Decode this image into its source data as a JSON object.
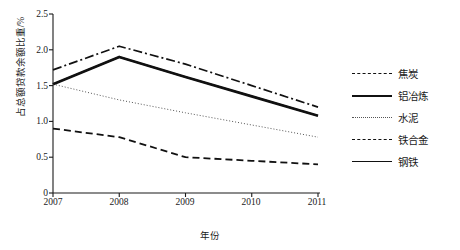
{
  "chart_data": {
    "type": "line",
    "title": "",
    "xlabel": "年份",
    "ylabel": "占总额贷款余额比重/%",
    "categories": [
      "2007",
      "2008",
      "2009",
      "2010",
      "2011"
    ],
    "x": [
      2007,
      2008,
      2009,
      2010,
      2011
    ],
    "ylim": [
      0,
      2.5
    ],
    "yticks": [
      "0",
      "0.5",
      "1.0",
      "1.5",
      "2.0",
      "2.5"
    ],
    "ytick_values": [
      0,
      0.5,
      1.0,
      1.5,
      2.0,
      2.5
    ],
    "grid": false,
    "legend_position": "right",
    "series": [
      {
        "name": "焦炭",
        "style": "dash-dot",
        "color": "#111111",
        "values": [
          1.72,
          2.05,
          1.8,
          1.5,
          1.2
        ]
      },
      {
        "name": "铝冶炼",
        "style": "solid-thick",
        "color": "#111111",
        "values": [
          1.52,
          1.9,
          1.62,
          1.35,
          1.08
        ]
      },
      {
        "name": "水泥",
        "style": "dotted",
        "color": "#555555",
        "values": [
          1.52,
          1.3,
          1.12,
          0.95,
          0.78
        ]
      },
      {
        "name": "铁合金",
        "style": "dashed",
        "color": "#111111",
        "values": [
          0.9,
          0.78,
          0.5,
          0.45,
          0.4
        ]
      },
      {
        "name": "钢铁",
        "style": "solid-thin",
        "color": "#111111",
        "values": [
          1.52,
          1.9,
          1.62,
          1.35,
          1.08
        ]
      }
    ]
  },
  "axes": {
    "y_axis_name": "y-axis",
    "x_axis_name": "x-axis"
  }
}
